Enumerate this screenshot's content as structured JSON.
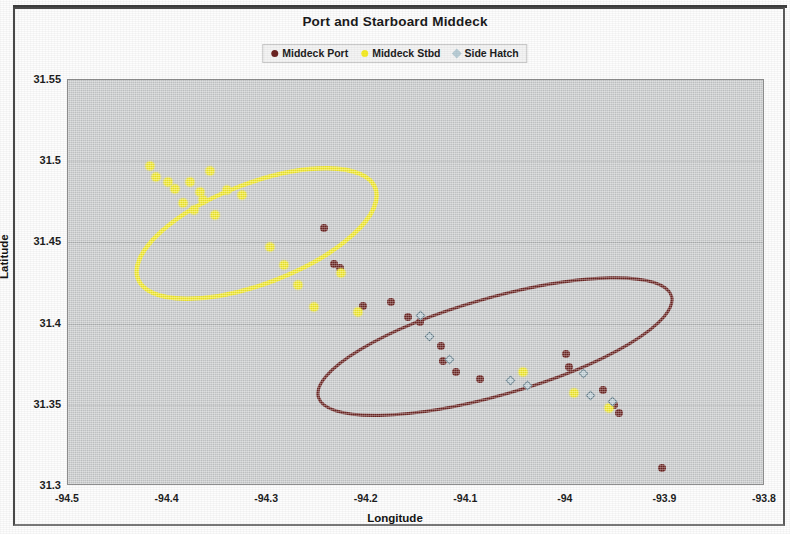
{
  "chart_data": {
    "type": "scatter",
    "title": "Port and Starboard Middeck",
    "xlabel": "Longitude",
    "ylabel": "Latitude",
    "xlim": [
      -94.5,
      -93.8
    ],
    "ylim": [
      31.3,
      31.55
    ],
    "xticks": [
      "-94.5",
      "-94.4",
      "-94.3",
      "-94.2",
      "-94.1",
      "-94",
      "-93.9",
      "-93.8"
    ],
    "xtick_values": [
      -94.5,
      -94.4,
      -94.3,
      -94.2,
      -94.1,
      -94.0,
      -93.9,
      -93.8
    ],
    "yticks": [
      "31.55",
      "31.5",
      "31.45",
      "31.4",
      "31.35",
      "31.3"
    ],
    "ytick_values": [
      31.55,
      31.5,
      31.45,
      31.4,
      31.35,
      31.3
    ],
    "grid": "horizontal",
    "legend_position": "top-center",
    "plot_background": "#cfd1d2",
    "series": [
      {
        "name": "Middeck Port",
        "color": "#6b2321",
        "marker": "circle",
        "points": [
          [
            -94.243,
            31.459
          ],
          [
            -94.233,
            31.437
          ],
          [
            -94.227,
            31.434
          ],
          [
            -94.204,
            31.411
          ],
          [
            -94.176,
            31.413
          ],
          [
            -94.159,
            31.404
          ],
          [
            -94.146,
            31.401
          ],
          [
            -94.125,
            31.386
          ],
          [
            -94.123,
            31.377
          ],
          [
            -94.11,
            31.37
          ],
          [
            -94.086,
            31.366
          ],
          [
            -94.0,
            31.381
          ],
          [
            -93.997,
            31.373
          ],
          [
            -93.963,
            31.359
          ],
          [
            -93.952,
            31.35
          ],
          [
            -93.947,
            31.345
          ],
          [
            -93.903,
            31.311
          ]
        ]
      },
      {
        "name": "Middeck Stbd",
        "color": "#f5ec2a",
        "marker": "circle",
        "points": [
          [
            -94.418,
            31.497
          ],
          [
            -94.412,
            31.49
          ],
          [
            -94.4,
            31.487
          ],
          [
            -94.393,
            31.483
          ],
          [
            -94.385,
            31.474
          ],
          [
            -94.377,
            31.487
          ],
          [
            -94.373,
            31.47
          ],
          [
            -94.367,
            31.481
          ],
          [
            -94.364,
            31.476
          ],
          [
            -94.357,
            31.494
          ],
          [
            -94.352,
            31.467
          ],
          [
            -94.34,
            31.482
          ],
          [
            -94.325,
            31.479
          ],
          [
            -94.297,
            31.447
          ],
          [
            -94.283,
            31.436
          ],
          [
            -94.269,
            31.424
          ],
          [
            -94.253,
            31.41
          ],
          [
            -94.226,
            31.431
          ],
          [
            -94.209,
            31.407
          ],
          [
            -94.043,
            31.37
          ],
          [
            -93.992,
            31.357
          ],
          [
            -93.957,
            31.348
          ]
        ]
      },
      {
        "name": "Side Hatch",
        "color": "#8fa3ad",
        "marker": "diamond",
        "points": [
          [
            -94.146,
            31.405
          ],
          [
            -94.137,
            31.392
          ],
          [
            -94.117,
            31.378
          ],
          [
            -94.056,
            31.365
          ],
          [
            -94.039,
            31.362
          ],
          [
            -93.982,
            31.369
          ],
          [
            -93.975,
            31.356
          ],
          [
            -93.953,
            31.352
          ]
        ]
      }
    ],
    "ellipses": [
      {
        "label": "Middeck Stbd confidence ellipse",
        "color": "#f5ec2a",
        "center": [
          -94.31,
          31.455
        ],
        "rx": 0.128,
        "ry": 0.031,
        "rotation_deg": -21
      },
      {
        "label": "Middeck Port confidence ellipse",
        "color": "#6b2321",
        "center": [
          -94.07,
          31.385
        ],
        "rx": 0.185,
        "ry": 0.03,
        "rotation_deg": -16
      }
    ]
  },
  "legend": {
    "items": [
      {
        "label": "Middeck Port",
        "color": "#6b2321",
        "marker": "circle"
      },
      {
        "label": "Middeck Stbd",
        "color": "#f5ec2a",
        "marker": "circle"
      },
      {
        "label": "Side Hatch",
        "color": "#b9cdd6",
        "marker": "diamond"
      }
    ]
  }
}
